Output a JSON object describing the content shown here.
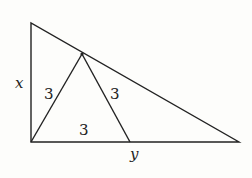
{
  "diagram": {
    "type": "geometry",
    "labels": {
      "left_side": "x",
      "left_segment": "3",
      "middle_segment": "3",
      "base_segment": "3",
      "base": "y"
    },
    "points": {
      "A_top_left": [
        31,
        23
      ],
      "B_bottom_left": [
        31,
        142
      ],
      "C_bottom_right": [
        239,
        142
      ],
      "D_on_hypotenuse": [
        82,
        54
      ],
      "E_on_base": [
        130,
        142
      ]
    },
    "colors": {
      "line": "#222222",
      "background": "#fdfdfb"
    }
  }
}
